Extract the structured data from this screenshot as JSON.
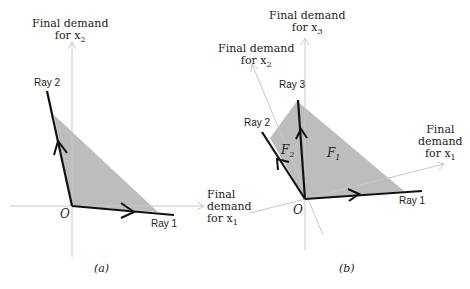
{
  "panel_a": {
    "caption": "(a)",
    "axis_y_label_line1": "Final demand",
    "axis_y_label_line2": "for x",
    "axis_y_sub": "2",
    "axis_x_label_line1": "Final",
    "axis_x_label_line2": "demand",
    "axis_x_label_line3": "for x",
    "axis_x_sub": "1",
    "origin": "O",
    "ray1": "Ray 1",
    "ray2": "Ray 2"
  },
  "panel_b": {
    "caption": "(b)",
    "axis_x3_line1": "Final demand",
    "axis_x3_line2": "for x",
    "axis_x3_sub": "3",
    "axis_x2_line1": "Final demand",
    "axis_x2_line2": "for x",
    "axis_x2_sub": "2",
    "axis_x1_line1": "Final",
    "axis_x1_line2": "demand",
    "axis_x1_line3": "for x",
    "axis_x1_sub": "1",
    "origin": "O",
    "ray1": "Ray 1",
    "ray2": "Ray 2",
    "ray3": "Ray 3",
    "face1": "F",
    "face1_sub": "1",
    "face2": "F",
    "face2_sub": "2"
  },
  "colors": {
    "shade": "#bdbdbd",
    "axis": "#c8c8c8",
    "ray": "#111111"
  }
}
